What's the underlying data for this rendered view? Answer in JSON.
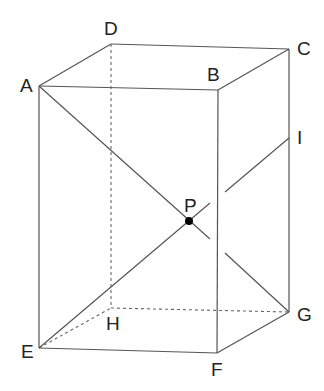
{
  "figure": {
    "type": "rectangular prism (cuboid) in oblique projection",
    "vertices": {
      "A": {
        "label": "A",
        "x": 39,
        "y": 86,
        "lx": 20,
        "ly": 92
      },
      "B": {
        "label": "B",
        "x": 218,
        "y": 90,
        "lx": 207,
        "ly": 81
      },
      "C": {
        "label": "C",
        "x": 289,
        "y": 49,
        "lx": 297,
        "ly": 55
      },
      "D": {
        "label": "D",
        "x": 111,
        "y": 44,
        "lx": 104,
        "ly": 35
      },
      "E": {
        "label": "E",
        "x": 39,
        "y": 348,
        "lx": 21,
        "ly": 358
      },
      "F": {
        "label": "F",
        "x": 217,
        "y": 353,
        "lx": 211,
        "ly": 376
      },
      "G": {
        "label": "G",
        "x": 289,
        "y": 312,
        "lx": 297,
        "ly": 321
      },
      "H": {
        "label": "H",
        "x": 111,
        "y": 308,
        "lx": 106,
        "ly": 330
      },
      "I": {
        "label": "I",
        "x": 289,
        "y": 138,
        "lx": 297,
        "ly": 144
      },
      "P": {
        "label": "P",
        "x": 189,
        "y": 221,
        "lx": 184,
        "ly": 212
      }
    },
    "visible_edges": [
      "AB",
      "BC",
      "CD",
      "DA",
      "AE",
      "BF",
      "CG",
      "EF",
      "FG"
    ],
    "hidden_edges": [
      "DH",
      "EH",
      "HG"
    ],
    "segments": [
      {
        "name": "AG",
        "description": "diagonal from A to G through P, broken where it passes behind edge BF"
      },
      {
        "name": "EI",
        "description": "segment from E to I through P, broken where it passes behind edge BF"
      }
    ],
    "point_P": "intersection of AG and EI, marked with a filled dot"
  }
}
